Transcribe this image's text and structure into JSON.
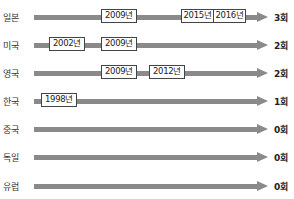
{
  "diagram": {
    "rows": [
      {
        "country": "일본",
        "count": "3회",
        "years": [
          "2009년",
          "2015년",
          "2016년"
        ]
      },
      {
        "country": "미국",
        "count": "2회",
        "years": [
          "2002년",
          "2009년"
        ]
      },
      {
        "country": "영국",
        "count": "2회",
        "years": [
          "2009년",
          "2012년"
        ]
      },
      {
        "country": "한국",
        "count": "1회",
        "years": [
          "1998년"
        ]
      },
      {
        "country": "중국",
        "count": "0회",
        "years": []
      },
      {
        "country": "독일",
        "count": "0회",
        "years": []
      },
      {
        "country": "유럽",
        "count": "0회",
        "years": []
      }
    ],
    "colors": {
      "bar": "#8a8a8a",
      "box_border": "#444444",
      "text": "#222222"
    }
  }
}
